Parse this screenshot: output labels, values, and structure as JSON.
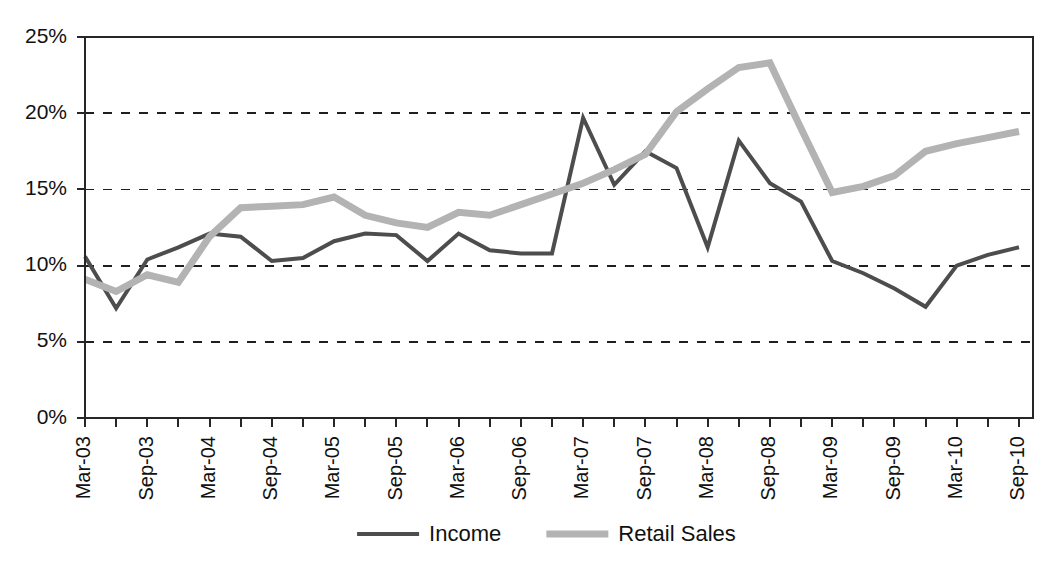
{
  "chart_data": {
    "type": "line",
    "title": "",
    "subtitle": "",
    "xlabel": "",
    "ylabel": "",
    "ylim": [
      0,
      25
    ],
    "yticks": [
      0,
      5,
      10,
      15,
      20,
      25
    ],
    "ytick_labels": [
      "0%",
      "5%",
      "10%",
      "15%",
      "20%",
      "25%"
    ],
    "grid": true,
    "grid_axis": "y",
    "legend_position": "bottom",
    "x": [
      "Mar-03",
      "Jun-03",
      "Sep-03",
      "Dec-03",
      "Mar-04",
      "Jun-04",
      "Sep-04",
      "Dec-04",
      "Mar-05",
      "Jun-05",
      "Sep-05",
      "Dec-05",
      "Mar-06",
      "Jun-06",
      "Sep-06",
      "Dec-06",
      "Mar-07",
      "Jun-07",
      "Sep-07",
      "Dec-07",
      "Mar-08",
      "Jun-08",
      "Sep-08",
      "Dec-08",
      "Mar-09",
      "Jun-09",
      "Sep-09",
      "Dec-09",
      "Mar-10",
      "Jun-10",
      "Sep-10"
    ],
    "xtick_labels": [
      "Mar-03",
      "",
      "Sep-03",
      "",
      "Mar-04",
      "",
      "Sep-04",
      "",
      "Mar-05",
      "",
      "Sep-05",
      "",
      "Mar-06",
      "",
      "Sep-06",
      "",
      "Mar-07",
      "",
      "Sep-07",
      "",
      "Mar-08",
      "",
      "Sep-08",
      "",
      "Mar-09",
      "",
      "Sep-09",
      "",
      "Mar-10",
      "",
      "Sep-10"
    ],
    "xtick_rotation": -90,
    "series": [
      {
        "name": "Income",
        "color": "#4d4d4d",
        "linewidth": 4,
        "values": [
          10.6,
          7.2,
          10.4,
          11.2,
          12.1,
          11.9,
          10.3,
          10.5,
          11.6,
          12.1,
          12.0,
          10.3,
          12.1,
          11.0,
          10.8,
          10.8,
          19.7,
          15.3,
          17.5,
          16.4,
          11.2,
          18.2,
          15.4,
          14.2,
          10.3,
          9.5,
          8.5,
          7.3,
          10.0,
          10.7,
          11.2
        ]
      },
      {
        "name": "Retail Sales",
        "color": "#b3b3b3",
        "linewidth": 7,
        "values": [
          9.1,
          8.3,
          9.4,
          8.9,
          11.9,
          13.8,
          13.9,
          14.0,
          14.5,
          13.3,
          12.8,
          12.5,
          13.5,
          13.3,
          14.0,
          14.7,
          15.4,
          16.3,
          17.3,
          20.1,
          21.6,
          23.0,
          23.3,
          19.0,
          14.8,
          15.2,
          15.9,
          17.5,
          18.0,
          18.4,
          18.8
        ]
      }
    ]
  },
  "legend": {
    "items": [
      {
        "label": "Income",
        "color": "#4d4d4d"
      },
      {
        "label": "Retail Sales",
        "color": "#b3b3b3"
      }
    ]
  }
}
